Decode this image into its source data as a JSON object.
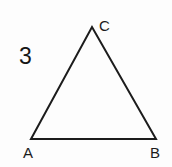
{
  "figure": {
    "kind": "geometry-triangle-diagram",
    "item_number": "3",
    "background_color": "#fdfdfd",
    "stroke_color": "#1c1c1c",
    "stroke_width": 2,
    "canvas": {
      "width": 172,
      "height": 167
    },
    "vertices": [
      {
        "name": "A",
        "label": "A",
        "x": 31,
        "y": 139,
        "label_x": 23,
        "label_y": 145
      },
      {
        "name": "B",
        "label": "B",
        "x": 156,
        "y": 139,
        "label_x": 150,
        "label_y": 145
      },
      {
        "name": "C",
        "label": "C",
        "x": 92,
        "y": 27,
        "label_x": 99,
        "label_y": 18
      }
    ],
    "sides": [
      {
        "name": "AB",
        "from": "A",
        "to": "B"
      },
      {
        "name": "BC",
        "from": "B",
        "to": "C"
      },
      {
        "name": "CA",
        "from": "C",
        "to": "A"
      }
    ]
  }
}
